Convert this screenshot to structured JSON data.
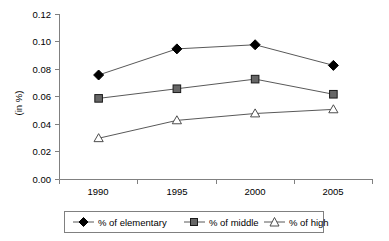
{
  "chart_data": {
    "type": "line",
    "title": "",
    "xlabel": "",
    "ylabel": "(in %)",
    "categories": [
      "1990",
      "1995",
      "2000",
      "2005"
    ],
    "series": [
      {
        "name": "% of elementary",
        "marker": "filled-diamond",
        "color": "#000000",
        "values": [
          0.076,
          0.095,
          0.098,
          0.083
        ]
      },
      {
        "name": "% of middle",
        "marker": "filled-square",
        "color": "#666666",
        "values": [
          0.059,
          0.066,
          0.073,
          0.062
        ]
      },
      {
        "name": "% of high",
        "marker": "open-triangle",
        "color": "#ffffff",
        "values": [
          0.03,
          0.043,
          0.048,
          0.051
        ]
      }
    ],
    "ylim": [
      0.0,
      0.12
    ],
    "ytick_values": [
      "0.00",
      "0.02",
      "0.04",
      "0.06",
      "0.08",
      "0.10",
      "0.12"
    ],
    "grid": false,
    "legend_position": "bottom",
    "line_color": "#595959",
    "axis_color": "#808080"
  },
  "axis": {
    "y_ticks": [
      "0.12",
      "0.10",
      "0.08",
      "0.06",
      "0.04",
      "0.02",
      "0.00"
    ],
    "x_ticks": [
      "1990",
      "1995",
      "2000",
      "2005"
    ],
    "y_title": "(in %)"
  },
  "legend": {
    "items": [
      {
        "label": "% of elementary",
        "icon": "filled-diamond-marker"
      },
      {
        "label": "% of middle",
        "icon": "filled-square-marker"
      },
      {
        "label": "% of high",
        "icon": "open-triangle-marker"
      }
    ]
  }
}
